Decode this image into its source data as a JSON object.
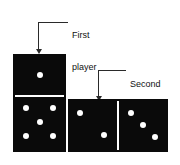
{
  "figure": {
    "type": "domino-diagram",
    "background_color": "#ffffff",
    "tile_color": "#0a0a0a",
    "pip_color": "#ffffff",
    "line_color": "#2a2a2a"
  },
  "annotations": [
    {
      "id": "first-player",
      "line1": "First",
      "line2": "player",
      "target": "vertical-domino-top-half"
    },
    {
      "id": "second-player",
      "line1": "Second",
      "line2": "player",
      "target": "horizontal-domino-left-half"
    }
  ],
  "dominoes": [
    {
      "id": "vertical-domino",
      "orientation": "vertical",
      "halves": [
        {
          "id": "top-half",
          "pip_count": 1
        },
        {
          "id": "bottom-half",
          "pip_count": 5
        }
      ]
    },
    {
      "id": "horizontal-domino",
      "orientation": "horizontal",
      "halves": [
        {
          "id": "left-half",
          "pip_count": 2
        },
        {
          "id": "right-half",
          "pip_count": 3
        }
      ]
    }
  ]
}
